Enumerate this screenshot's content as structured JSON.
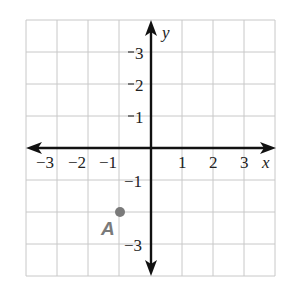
{
  "figure": {
    "type": "coordinate-plane",
    "x_axis": {
      "label": "x",
      "min": -4,
      "max": 4,
      "ticks": [
        "−3",
        "−2",
        "−1",
        "1",
        "2",
        "3"
      ]
    },
    "y_axis": {
      "label": "y",
      "min": -4,
      "max": 4,
      "ticks": [
        "3",
        "2",
        "1",
        "−1",
        "−3"
      ]
    },
    "grid": {
      "on": true,
      "color": "#c8c8c8"
    },
    "axis_color": "#111111",
    "points": [
      {
        "name": "A",
        "x": -1,
        "y": -2,
        "color": "#7a7a7a"
      }
    ]
  },
  "labels": {
    "x_name": "x",
    "y_name": "y",
    "x_neg3": "−3",
    "x_neg2": "−2",
    "x_neg1": "−1",
    "x_1": "1",
    "x_2": "2",
    "x_3": "3",
    "y_3": "3",
    "y_2": "2",
    "y_1": "1",
    "y_neg1": "−1",
    "y_neg3": "−3",
    "point_a": "A"
  }
}
